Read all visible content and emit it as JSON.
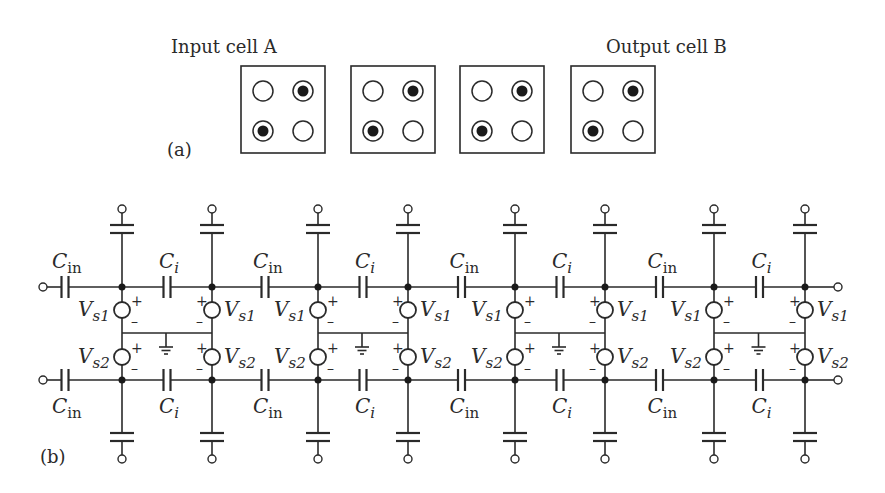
{
  "figure": {
    "part_a": {
      "panel_label": "(a)",
      "input_label": "Input cell A",
      "output_label": "Output cell B",
      "cells": [
        {
          "name": "cell-1",
          "dots": [
            [
              0,
              1
            ],
            [
              1,
              0
            ]
          ]
        },
        {
          "name": "cell-2",
          "dots": [
            [
              0,
              1
            ],
            [
              1,
              0
            ]
          ]
        },
        {
          "name": "cell-3",
          "dots": [
            [
              0,
              1
            ],
            [
              1,
              0
            ]
          ]
        },
        {
          "name": "cell-4",
          "dots": [
            [
              0,
              1
            ],
            [
              1,
              0
            ]
          ]
        }
      ]
    },
    "part_b": {
      "panel_label": "(b)",
      "labels": {
        "c_in_main": "C",
        "c_in_sub": "in",
        "c_i_main": "C",
        "c_i_sub": "i",
        "vs_main": "V",
        "vs1_sub": "s1",
        "vs2_sub": "s2",
        "plus": "+",
        "minus": "–"
      },
      "stages": 4,
      "node_columns": [
        122,
        212,
        318,
        408,
        515,
        605,
        714,
        805
      ],
      "rails": {
        "top_y": 287,
        "bottom_y": 380
      },
      "input_terminal_x": 43,
      "output_terminal_x": 838
    }
  }
}
